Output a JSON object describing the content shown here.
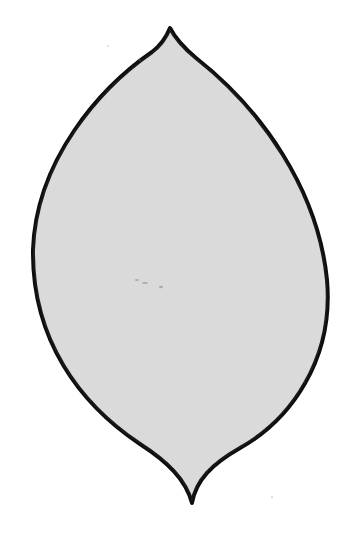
{
  "image": {
    "description": "Hand-drawn leaf/lens shape outline filled with light gray on white paper",
    "shape": "leaf-outline",
    "colors": {
      "background": "#ffffff",
      "fill": "#d9d9d9",
      "stroke": "#0d0d0d"
    },
    "tips": {
      "top": [
        170,
        28
      ],
      "bottom": [
        192,
        503
      ]
    },
    "extents": {
      "left": 33,
      "right": 328
    }
  }
}
